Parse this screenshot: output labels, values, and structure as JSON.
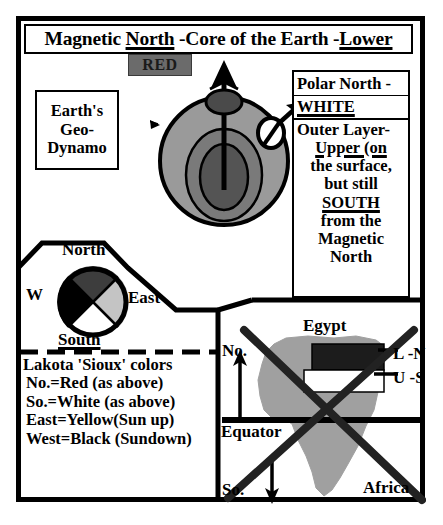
{
  "title": {
    "full": "Magnetic North -Core of the Earth -Lower",
    "part1": "Magnetic ",
    "part2_underlined": "North",
    "part3": " -Core of the Earth -",
    "part4_underlined": "Lower"
  },
  "red_chip": {
    "label": "RED",
    "box_color": "#6b6b6b",
    "text_color": "#1a1a1a"
  },
  "geo_dynamo": {
    "lines": [
      "Earth's",
      "Geo-",
      "Dynamo"
    ]
  },
  "earth": {
    "outer_layer_color": "#9a9a9a",
    "mid_layer_color": "#7a7a7a",
    "core_color": "#555555",
    "pole_cap_color": "#555555",
    "arrow_color": "#000000"
  },
  "right_panel": {
    "row1": "Polar North -",
    "row2_underlined": "WHITE",
    "body": [
      "Outer Layer-",
      "Upper (on",
      "the surface,",
      "but still",
      "SOUTH",
      "from the",
      "Magnetic",
      "North"
    ],
    "underlined_lines": [
      "Upper (on",
      "SOUTH"
    ]
  },
  "compass": {
    "labels": {
      "north": "North",
      "west": "W",
      "east": "East",
      "south": "South"
    },
    "quadrants": [
      {
        "direction": "North",
        "color": "#3d3d3d",
        "meaning": "Red"
      },
      {
        "direction": "East",
        "color": "#c4c4c4",
        "meaning": "Yellow"
      },
      {
        "direction": "South",
        "color": "#ffffff",
        "meaning": "White"
      },
      {
        "direction": "West",
        "color": "#000000",
        "meaning": "Black"
      }
    ]
  },
  "lakota": {
    "title": "Lakota 'Sioux' colors",
    "items": [
      "No.=Red (as above)",
      "So.=White (as above)",
      "East=Yellow(Sun up)",
      "West=Black (Sundown)"
    ]
  },
  "africa": {
    "egypt": "Egypt",
    "north_abbrev": "No.",
    "south_abbrev": "So.",
    "equator": "Equator",
    "continent": "Africa",
    "lower_north": "L -N",
    "upper_south": "U -S",
    "continent_color": "#a0a0a0",
    "lower_band_color": "#1c1c1c",
    "upper_band_color": "#ffffff",
    "crossed_out": true
  }
}
